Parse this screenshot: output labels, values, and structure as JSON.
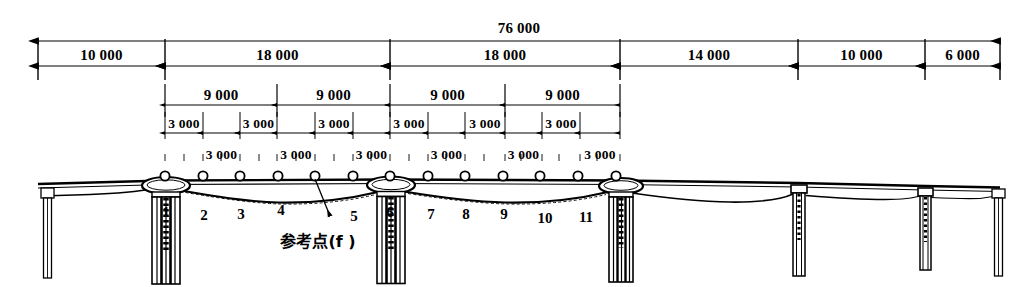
{
  "drawing": {
    "title": "Bridge elevation with span dimensions and measurement point numbering",
    "units_note": "",
    "ink_color": "#000000",
    "background_color": "#ffffff"
  },
  "dimensions": {
    "overall": {
      "label": "76 000",
      "x_start_px": 38,
      "x_end_px": 1000,
      "y_px": 41
    },
    "spans_row": {
      "y_px": 66,
      "ticks_px": [
        38,
        165,
        390,
        620,
        798,
        925,
        1000
      ],
      "items": [
        {
          "label": "10 000",
          "from_px": 38,
          "to_px": 165
        },
        {
          "label": "18 000",
          "from_px": 165,
          "to_px": 390
        },
        {
          "label": "18 000",
          "from_px": 390,
          "to_px": 620
        },
        {
          "label": "14 000",
          "from_px": 620,
          "to_px": 798
        },
        {
          "label": "10 000",
          "from_px": 798,
          "to_px": 925
        },
        {
          "label": "6 000",
          "from_px": 925,
          "to_px": 1000
        }
      ]
    },
    "nine_thousand_row": {
      "y_px": 105,
      "ticks_px": [
        165,
        277,
        390,
        505,
        620
      ],
      "items": [
        {
          "label": "9 000",
          "from_px": 165,
          "to_px": 277
        },
        {
          "label": "9 000",
          "from_px": 277,
          "to_px": 390
        },
        {
          "label": "9 000",
          "from_px": 390,
          "to_px": 505
        },
        {
          "label": "9 000",
          "from_px": 505,
          "to_px": 620
        }
      ]
    },
    "three_thousand_row_upper": {
      "y_px": 133,
      "ticks_px": [
        165,
        203,
        240,
        277,
        315,
        353,
        390,
        428,
        465,
        505,
        542,
        580,
        620
      ],
      "items": [
        {
          "label": "3 000",
          "from_px": 165,
          "to_px": 203
        },
        {
          "label": "3 000",
          "from_px": 240,
          "to_px": 277
        },
        {
          "label": "3 000",
          "from_px": 315,
          "to_px": 353
        },
        {
          "label": "3 000",
          "from_px": 390,
          "to_px": 428
        },
        {
          "label": "3 000",
          "from_px": 465,
          "to_px": 505
        },
        {
          "label": "3 000",
          "from_px": 542,
          "to_px": 580
        }
      ]
    },
    "three_thousand_row_lower": {
      "y_px": 163,
      "ticks_px": [
        184,
        221,
        259,
        296,
        334,
        371,
        409,
        446,
        484,
        521,
        559,
        597
      ],
      "items": [
        {
          "label": "3 000",
          "from_px": 203,
          "to_px": 240
        },
        {
          "label": "3 000",
          "from_px": 277,
          "to_px": 315
        },
        {
          "label": "3 000",
          "from_px": 353,
          "to_px": 390
        },
        {
          "label": "3 000",
          "from_px": 428,
          "to_px": 465
        },
        {
          "label": "3 000",
          "from_px": 505,
          "to_px": 542
        },
        {
          "label": "3 000",
          "from_px": 580,
          "to_px": 620
        }
      ]
    }
  },
  "deck": {
    "measurement_points": [
      {
        "cx_px": 165,
        "cy_px": 176
      },
      {
        "cx_px": 203,
        "cy_px": 176
      },
      {
        "cx_px": 240,
        "cy_px": 176
      },
      {
        "cx_px": 278,
        "cy_px": 176
      },
      {
        "cx_px": 315,
        "cy_px": 176
      },
      {
        "cx_px": 353,
        "cy_px": 176
      },
      {
        "cx_px": 390,
        "cy_px": 176
      },
      {
        "cx_px": 428,
        "cy_px": 176
      },
      {
        "cx_px": 465,
        "cy_px": 176
      },
      {
        "cx_px": 503,
        "cy_px": 176
      },
      {
        "cx_px": 540,
        "cy_px": 176
      },
      {
        "cx_px": 578,
        "cy_px": 176
      },
      {
        "cx_px": 616,
        "cy_px": 176
      }
    ],
    "point_numbers": [
      {
        "label": "1",
        "x_px": 166,
        "y_px": 204
      },
      {
        "label": "2",
        "x_px": 204,
        "y_px": 207
      },
      {
        "label": "3",
        "x_px": 241,
        "y_px": 206
      },
      {
        "label": "4",
        "x_px": 281,
        "y_px": 202
      },
      {
        "label": "5",
        "x_px": 354,
        "y_px": 208
      },
      {
        "label": "6",
        "x_px": 390,
        "y_px": 204
      },
      {
        "label": "7",
        "x_px": 431,
        "y_px": 206
      },
      {
        "label": "8",
        "x_px": 466,
        "y_px": 206
      },
      {
        "label": "9",
        "x_px": 504,
        "y_px": 206
      },
      {
        "label": "10",
        "x_px": 545,
        "y_px": 210
      },
      {
        "label": "11",
        "x_px": 586,
        "y_px": 209
      }
    ]
  },
  "annotation": {
    "reference_point": {
      "label": "参考点(f )",
      "x_px": 318,
      "y_px": 228,
      "leader_from_px": [
        315,
        179
      ],
      "leader_to_px": [
        330,
        216
      ]
    }
  }
}
